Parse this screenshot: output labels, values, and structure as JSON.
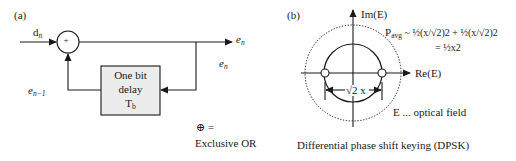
{
  "panel_a": {
    "tag": "(a)",
    "input_label": "d",
    "input_sub": "n",
    "xor_symbol": "+",
    "output_label": "e",
    "output_sub": "n",
    "tap_label": "e",
    "tap_sub": "n",
    "feedback_label": "e",
    "feedback_sub": "n−1",
    "delay_box": {
      "line1": "One bit",
      "line2": "delay",
      "line3": "T",
      "line3_sub": "b"
    },
    "legend_symbol": "⊕ =",
    "legend_text": "Exclusive OR"
  },
  "panel_b": {
    "tag": "(b)",
    "y_axis_label": "Im(E)",
    "x_axis_label": "Re(E)",
    "p_avg_label": "P",
    "p_avg_sub": "avg",
    "formula_line1": " ~ ½(x/√2)2 + ½(x/√2)2",
    "formula_line2": "= ½x2",
    "distance_label": "√2 x",
    "field_note": "E ... optical field",
    "caption": "Differential phase shift keying (DPSK)"
  },
  "colors": {
    "stroke": "#1a1a1a",
    "box_fill": "#ececec",
    "background": "#ffffff"
  }
}
